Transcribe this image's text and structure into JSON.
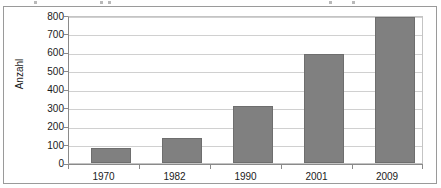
{
  "figure": {
    "cropped_top_line": ""
  },
  "chart_data": {
    "type": "bar",
    "title": "",
    "xlabel": "",
    "ylabel": "Anzahl",
    "categories": [
      "1970",
      "1982",
      "1990",
      "2001",
      "2009"
    ],
    "values": [
      80,
      135,
      310,
      600,
      800
    ],
    "ylim": [
      0,
      800
    ],
    "ytick_step": 100,
    "yticks": [
      "800",
      "700",
      "600",
      "500",
      "400",
      "300",
      "200",
      "100",
      "0"
    ],
    "ytick_values": [
      800,
      700,
      600,
      500,
      400,
      300,
      200,
      100,
      0
    ],
    "grid": true,
    "legend": false,
    "legend_position": "none",
    "bar_color": "#808080",
    "bar_border_color": "#6e6e6e",
    "gridline_color": "#d0d0d0",
    "axis_color": "#8a8a8a",
    "background_color": "#ffffff",
    "text_color": "#1a1a1a"
  }
}
